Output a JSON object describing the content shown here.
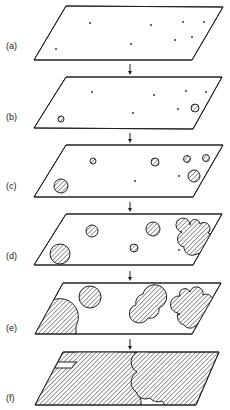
{
  "figure": {
    "colors": {
      "ink": "#222222",
      "background": "#ffffff"
    },
    "panels": [
      {
        "label": "(a)",
        "label_y": 47,
        "plane": [
          [
            66,
            6
          ],
          [
            223,
            7
          ],
          [
            192,
            60
          ],
          [
            34,
            60
          ]
        ],
        "dots": [
          [
            90,
            23
          ],
          [
            151,
            25
          ],
          [
            183,
            22
          ],
          [
            204,
            22
          ],
          [
            56,
            49
          ],
          [
            131,
            44
          ],
          [
            175,
            40
          ],
          [
            192,
            37
          ]
        ],
        "circles": [],
        "blobs": []
      },
      {
        "label": "(b)",
        "label_y": 118,
        "plane": [
          [
            66,
            77
          ],
          [
            222,
            77
          ],
          [
            193,
            129
          ],
          [
            34,
            128
          ]
        ],
        "dots": [
          [
            92,
            92
          ],
          [
            154,
            95
          ],
          [
            186,
            91
          ],
          [
            206,
            92
          ],
          [
            133,
            113
          ],
          [
            178,
            109
          ]
        ],
        "circles": [
          [
            61,
            119,
            3
          ],
          [
            195,
            108,
            4
          ]
        ],
        "blobs": []
      },
      {
        "label": "(c)",
        "label_y": 187,
        "plane": [
          [
            66,
            145
          ],
          [
            223,
            145
          ],
          [
            193,
            197
          ],
          [
            34,
            197
          ]
        ],
        "dots": [
          [
            135,
            181
          ],
          [
            179,
            176
          ]
        ],
        "circles": [
          [
            93,
            161,
            3
          ],
          [
            155,
            162,
            4
          ],
          [
            187,
            159,
            3.5
          ],
          [
            206,
            158,
            3.5
          ],
          [
            194,
            176,
            6
          ],
          [
            61,
            186,
            7
          ]
        ],
        "blobs": []
      },
      {
        "label": "(d)",
        "label_y": 257,
        "plane": [
          [
            66,
            214
          ],
          [
            222,
            214
          ],
          [
            193,
            265
          ],
          [
            34,
            265
          ]
        ],
        "dots": [
          [
            179,
            250
          ]
        ],
        "circles": [
          [
            92,
            231,
            6
          ],
          [
            153,
            229,
            7
          ],
          [
            134,
            248,
            4
          ],
          [
            60,
            254,
            10
          ]
        ],
        "blobs": [
          "M182,232 a7,7 0 1 1 8,-7 a5,5 0 0 1 10,-1 a6,6 0 0 1 8,9 a5,5 0 0 1 -2,12 a6,6 0 0 1 -6,8 l-6,2 a8,8 0 0 1 -10,-8 a8,8 0 0 1 -2,-15 z"
        ]
      },
      {
        "label": "(e)",
        "label_y": 329,
        "plane": [
          [
            63,
            283
          ],
          [
            221,
            283
          ],
          [
            192,
            334
          ],
          [
            35,
            334
          ]
        ],
        "dots": [
          [
            179,
            314
          ]
        ],
        "circles": [
          [
            90,
            297,
            11
          ]
        ],
        "blobs": [
          "M35,334 L44,308 a16,16 0 0 1 32,18 L76,334 z",
          "M136,305 a9,9 0 0 1 7,-11 a12,12 0 1 1 16,14 a9,9 0 0 1 -11,10 a10,10 0 0 1 -13,4 a9,9 0 0 1 1,-17 z",
          "M180,296 a5,5 0 0 1 10,-4 a6,6 0 0 1 13,3 a7,7 0 0 1 9,10 a9,9 0 0 1 -4,12 l-6,10 l-7,-1 a7,7 0 0 1 -11,-1 a9,9 0 0 1 -6,-12 a8,8 0 0 1 2,-17 z"
        ]
      },
      {
        "label": "(f)",
        "label_y": 399,
        "plane": [
          [
            63,
            352
          ],
          [
            219,
            352
          ],
          [
            196,
            405
          ],
          [
            35,
            405
          ]
        ],
        "dots": [],
        "circles": [],
        "blobs": [
          "M63,352 L76,352 a14,14 0 0 1 20,-1 L128,352 a12,12 0 0 1 6,24 a8,8 0 0 1 0,14 a16,16 0 0 1 7,15 L35,405 L52,368 L72,368 a10,10 0 0 1 5,-6 L58,362 z",
          "M148,352 L219,352 L196,405 L165,405 l-3,-4 a10,10 0 0 1 -12,-3 a10,10 0 0 1 -14,-6 a12,12 0 0 1 1,-20 a10,10 0 0 1 11,-20 z"
        ]
      }
    ],
    "arrows": [
      {
        "x": 130,
        "y1": 64,
        "y2": 75
      },
      {
        "x": 130,
        "y1": 133,
        "y2": 143
      },
      {
        "x": 130,
        "y1": 202,
        "y2": 212
      },
      {
        "x": 130,
        "y1": 271,
        "y2": 281
      },
      {
        "x": 130,
        "y1": 339,
        "y2": 350
      }
    ]
  }
}
